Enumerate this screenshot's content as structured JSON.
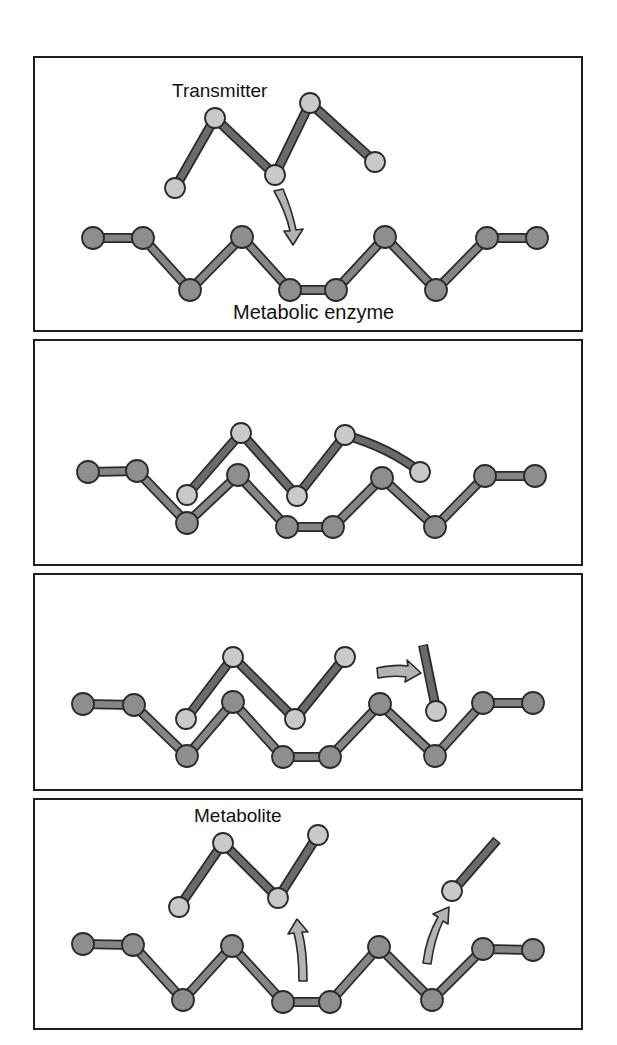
{
  "diagram": {
    "colors": {
      "enzyme_node": "#8e8e8e",
      "enzyme_bond": "#858585",
      "transmitter_node": "#c9c9c9",
      "transmitter_bond": "#6b6b6b",
      "arrow_fill": "#b3b3b3",
      "outline": "#2a2a2a"
    },
    "panels": [
      {
        "id": "panel-1-binding",
        "labels": {
          "transmitter": "Transmitter",
          "enzyme": "Metabolic enzyme"
        }
      },
      {
        "id": "panel-2-bound"
      },
      {
        "id": "panel-3-cleavage"
      },
      {
        "id": "panel-4-release",
        "labels": {
          "metabolite": "Metabolite"
        }
      }
    ]
  }
}
